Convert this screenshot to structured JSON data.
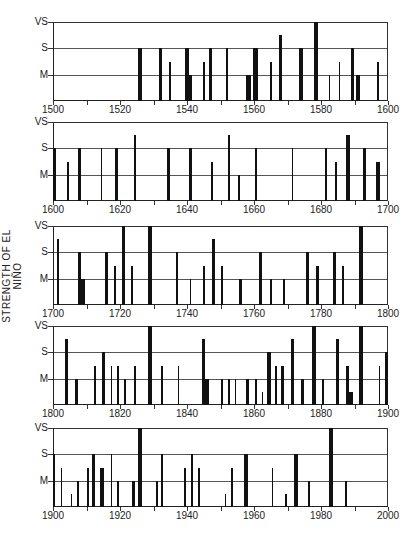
{
  "chart_data": {
    "type": "bar",
    "title": "",
    "ylabel": "STRENGTH OF EL NIÑO",
    "xlabel": "",
    "strength_scale": {
      "VS": 3,
      "S": 2,
      "M": 1
    },
    "y_tick_labels": [
      "VS",
      "S",
      "M"
    ],
    "grid": true,
    "panels": [
      {
        "range": [
          1500,
          1600
        ],
        "x_tick_labels": [
          "1500",
          "1520",
          "1540",
          "1560",
          "1580",
          "1600"
        ],
        "events": [
          {
            "year": 1526,
            "strength": 2,
            "width": 1
          },
          {
            "year": 1532,
            "strength": 2,
            "width": 1
          },
          {
            "year": 1535,
            "strength": 1.5,
            "width": 0.5
          },
          {
            "year": 1540,
            "strength": 2,
            "width": 1
          },
          {
            "year": 1541,
            "strength": 1,
            "width": 1
          },
          {
            "year": 1545,
            "strength": 1.5,
            "width": 0.5
          },
          {
            "year": 1547,
            "strength": 2,
            "width": 1
          },
          {
            "year": 1552,
            "strength": 2,
            "width": 0.5
          },
          {
            "year": 1558.5,
            "strength": 1,
            "width": 1.5
          },
          {
            "year": 1560.5,
            "strength": 2,
            "width": 1.5
          },
          {
            "year": 1565,
            "strength": 1.5,
            "width": 0.5
          },
          {
            "year": 1568,
            "strength": 2.5,
            "width": 1
          },
          {
            "year": 1574,
            "strength": 2,
            "width": 1
          },
          {
            "year": 1578.5,
            "strength": 3,
            "width": 1
          },
          {
            "year": 1582.5,
            "strength": 1,
            "width": 0.5
          },
          {
            "year": 1585.5,
            "strength": 1.5,
            "width": 0.5
          },
          {
            "year": 1589.5,
            "strength": 2,
            "width": 1
          },
          {
            "year": 1591,
            "strength": 1,
            "width": 1
          },
          {
            "year": 1597,
            "strength": 1.5,
            "width": 0.5
          }
        ]
      },
      {
        "range": [
          1600,
          1700
        ],
        "x_tick_labels": [
          "1600",
          "1620",
          "1640",
          "1660",
          "1680",
          "1700"
        ],
        "events": [
          {
            "year": 1600.5,
            "strength": 2,
            "width": 1
          },
          {
            "year": 1604.5,
            "strength": 1.5,
            "width": 0.5
          },
          {
            "year": 1608,
            "strength": 2,
            "width": 1
          },
          {
            "year": 1614.5,
            "strength": 2,
            "width": 0.5
          },
          {
            "year": 1619,
            "strength": 2,
            "width": 1
          },
          {
            "year": 1624.5,
            "strength": 2.5,
            "width": 0.5
          },
          {
            "year": 1634.5,
            "strength": 2,
            "width": 1
          },
          {
            "year": 1641,
            "strength": 2,
            "width": 1
          },
          {
            "year": 1647.5,
            "strength": 1.5,
            "width": 0.5
          },
          {
            "year": 1652.5,
            "strength": 2.5,
            "width": 0.5
          },
          {
            "year": 1655.5,
            "strength": 1,
            "width": 0.5
          },
          {
            "year": 1660.5,
            "strength": 2,
            "width": 0.5
          },
          {
            "year": 1671.5,
            "strength": 2,
            "width": 0.5
          },
          {
            "year": 1681.5,
            "strength": 2,
            "width": 0.5
          },
          {
            "year": 1684.5,
            "strength": 1.5,
            "width": 0.5
          },
          {
            "year": 1688,
            "strength": 2.5,
            "width": 1.2
          },
          {
            "year": 1693,
            "strength": 2,
            "width": 1
          },
          {
            "year": 1697,
            "strength": 1.5,
            "width": 1
          }
        ]
      },
      {
        "range": [
          1700,
          1800
        ],
        "x_tick_labels": [
          "1700",
          "1720",
          "1740",
          "1760",
          "1780",
          "1800"
        ],
        "events": [
          {
            "year": 1701.5,
            "strength": 2.5,
            "width": 0.5
          },
          {
            "year": 1708,
            "strength": 2,
            "width": 1
          },
          {
            "year": 1709,
            "strength": 1,
            "width": 1
          },
          {
            "year": 1716,
            "strength": 2,
            "width": 1
          },
          {
            "year": 1718.5,
            "strength": 1.5,
            "width": 0.5
          },
          {
            "year": 1721,
            "strength": 3,
            "width": 1
          },
          {
            "year": 1723.5,
            "strength": 1.5,
            "width": 0.5
          },
          {
            "year": 1729,
            "strength": 3,
            "width": 1
          },
          {
            "year": 1737,
            "strength": 2,
            "width": 0.5
          },
          {
            "year": 1741,
            "strength": 1,
            "width": 0.5
          },
          {
            "year": 1745,
            "strength": 1.5,
            "width": 0.5
          },
          {
            "year": 1748,
            "strength": 2.5,
            "width": 1
          },
          {
            "year": 1750.5,
            "strength": 1.5,
            "width": 0.5
          },
          {
            "year": 1756,
            "strength": 1,
            "width": 0.8
          },
          {
            "year": 1762,
            "strength": 2,
            "width": 1
          },
          {
            "year": 1765,
            "strength": 1,
            "width": 0.5
          },
          {
            "year": 1769,
            "strength": 1,
            "width": 0.5
          },
          {
            "year": 1776,
            "strength": 2,
            "width": 1
          },
          {
            "year": 1779,
            "strength": 1.5,
            "width": 0.8
          },
          {
            "year": 1784,
            "strength": 2,
            "width": 1
          },
          {
            "year": 1786.5,
            "strength": 1.5,
            "width": 0.5
          },
          {
            "year": 1792,
            "strength": 3,
            "width": 1.2
          }
        ]
      },
      {
        "range": [
          1800,
          1900
        ],
        "x_tick_labels": [
          "1800",
          "1820",
          "1840",
          "1860",
          "1880",
          "1900"
        ],
        "events": [
          {
            "year": 1804,
            "strength": 2.5,
            "width": 1
          },
          {
            "year": 1807,
            "strength": 1,
            "width": 1
          },
          {
            "year": 1812.5,
            "strength": 1.5,
            "width": 0.5
          },
          {
            "year": 1815,
            "strength": 2,
            "width": 1
          },
          {
            "year": 1817.5,
            "strength": 1.5,
            "width": 0.5
          },
          {
            "year": 1819.5,
            "strength": 1.5,
            "width": 0.5
          },
          {
            "year": 1821.5,
            "strength": 1,
            "width": 0.5
          },
          {
            "year": 1824.5,
            "strength": 1.5,
            "width": 0.5
          },
          {
            "year": 1829,
            "strength": 3,
            "width": 1
          },
          {
            "year": 1832.5,
            "strength": 1.5,
            "width": 0.5
          },
          {
            "year": 1837.5,
            "strength": 1.5,
            "width": 0.5
          },
          {
            "year": 1845,
            "strength": 2.5,
            "width": 1
          },
          {
            "year": 1846,
            "strength": 1,
            "width": 1
          },
          {
            "year": 1850.5,
            "strength": 1,
            "width": 0.5
          },
          {
            "year": 1852.5,
            "strength": 1,
            "width": 0.5
          },
          {
            "year": 1854.5,
            "strength": 1,
            "width": 0.5
          },
          {
            "year": 1858,
            "strength": 1,
            "width": 1
          },
          {
            "year": 1860.5,
            "strength": 1,
            "width": 0.5
          },
          {
            "year": 1862.5,
            "strength": 0.5,
            "width": 0.5
          },
          {
            "year": 1864.5,
            "strength": 2,
            "width": 1
          },
          {
            "year": 1866.5,
            "strength": 1.5,
            "width": 0.5
          },
          {
            "year": 1868.5,
            "strength": 1.5,
            "width": 0.8
          },
          {
            "year": 1871.5,
            "strength": 2.5,
            "width": 0.8
          },
          {
            "year": 1874.5,
            "strength": 1,
            "width": 0.8
          },
          {
            "year": 1878,
            "strength": 3,
            "width": 1.2
          },
          {
            "year": 1880.5,
            "strength": 1,
            "width": 0.5
          },
          {
            "year": 1885,
            "strength": 2.5,
            "width": 0.8
          },
          {
            "year": 1888,
            "strength": 1.5,
            "width": 0.8
          },
          {
            "year": 1889,
            "strength": 0.5,
            "width": 1
          },
          {
            "year": 1892,
            "strength": 3,
            "width": 1.2
          },
          {
            "year": 1897.5,
            "strength": 1.5,
            "width": 0.5
          },
          {
            "year": 1899.5,
            "strength": 2,
            "width": 0.8
          }
        ]
      },
      {
        "range": [
          1900,
          2000
        ],
        "x_tick_labels": [
          "1900",
          "1920",
          "1940",
          "1960",
          "1980",
          "2000"
        ],
        "events": [
          {
            "year": 1900.3,
            "strength": 2,
            "width": 0.5
          },
          {
            "year": 1902.5,
            "strength": 1.5,
            "width": 0.5
          },
          {
            "year": 1905.5,
            "strength": 0.5,
            "width": 0.5
          },
          {
            "year": 1907.5,
            "strength": 1,
            "width": 0.5
          },
          {
            "year": 1910.5,
            "strength": 1.5,
            "width": 0.5
          },
          {
            "year": 1912,
            "strength": 2,
            "width": 1
          },
          {
            "year": 1914.5,
            "strength": 1.5,
            "width": 1.2
          },
          {
            "year": 1917.5,
            "strength": 2,
            "width": 0.5
          },
          {
            "year": 1919.5,
            "strength": 1,
            "width": 0.5
          },
          {
            "year": 1924,
            "strength": 1,
            "width": 0.8
          },
          {
            "year": 1926,
            "strength": 3,
            "width": 1.2
          },
          {
            "year": 1931,
            "strength": 1,
            "width": 0.5
          },
          {
            "year": 1932.5,
            "strength": 2,
            "width": 0.5
          },
          {
            "year": 1939.5,
            "strength": 1.5,
            "width": 0.5
          },
          {
            "year": 1941.5,
            "strength": 2,
            "width": 0.5
          },
          {
            "year": 1943.5,
            "strength": 1.5,
            "width": 0.5
          },
          {
            "year": 1951.5,
            "strength": 0.5,
            "width": 0.5
          },
          {
            "year": 1953.5,
            "strength": 1.5,
            "width": 0.5
          },
          {
            "year": 1957.5,
            "strength": 2,
            "width": 1.2
          },
          {
            "year": 1965.5,
            "strength": 1.5,
            "width": 0.5
          },
          {
            "year": 1969.5,
            "strength": 0.5,
            "width": 0.5
          },
          {
            "year": 1972.5,
            "strength": 2,
            "width": 1
          },
          {
            "year": 1976.5,
            "strength": 1,
            "width": 0.5
          },
          {
            "year": 1983,
            "strength": 3,
            "width": 1.2
          },
          {
            "year": 1987.5,
            "strength": 1,
            "width": 0.5
          }
        ]
      }
    ]
  }
}
